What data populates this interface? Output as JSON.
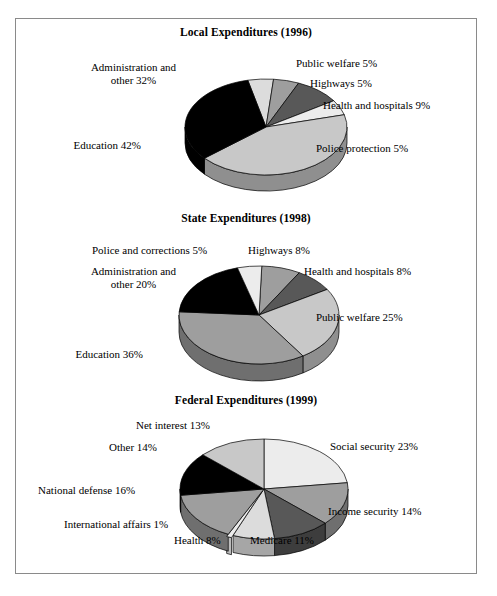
{
  "page": {
    "background": "#ffffff",
    "frame_border_color": "#8a8a8a"
  },
  "palette": {
    "black": "#000000",
    "dark_gray": "#585858",
    "mid_gray": "#9e9e9e",
    "light_gray": "#c8c8c8",
    "pale_gray": "#dcdcdc",
    "very_light": "#ececec",
    "side_black": "#000000",
    "side_dark": "#3d3d3d",
    "side_mid": "#6f6f6f",
    "side_light": "#8f8f8f",
    "side_pale": "#a6a6a6",
    "side_very_light": "#bdbdbd",
    "outline": "#000000"
  },
  "chart_data": [
    {
      "type": "pie",
      "id": "local-expenditures-1996",
      "title": "Local Expenditures (1996)",
      "categories": [
        "Education",
        "Administration and other",
        "Public welfare",
        "Highways",
        "Health and hospitals",
        "Police protection"
      ],
      "values": [
        42,
        32,
        5,
        5,
        9,
        5
      ],
      "labels": [
        "Education 42%",
        "Administration and other 32%",
        "Public welfare 5%",
        "Highways 5%",
        "Health and hospitals 9%",
        "Police protection 5%"
      ],
      "xlabel": "",
      "ylabel": "",
      "legend": "labels-outside",
      "grid": false
    },
    {
      "type": "pie",
      "id": "state-expenditures-1998",
      "title": "State Expenditures (1998)",
      "categories": [
        "Education",
        "Public welfare",
        "Administration and other",
        "Highways",
        "Health and hospitals",
        "Police and corrections"
      ],
      "values": [
        36,
        25,
        20,
        8,
        8,
        5
      ],
      "labels": [
        "Education 36%",
        "Public welfare 25%",
        "Administration and other 20%",
        "Highways 8%",
        "Health and hospitals 8%",
        "Police and corrections 5%"
      ],
      "xlabel": "",
      "ylabel": "",
      "legend": "labels-outside",
      "grid": false
    },
    {
      "type": "pie",
      "id": "federal-expenditures-1999",
      "title": "Federal Expenditures (1999)",
      "categories": [
        "Social security",
        "National defense",
        "Income security",
        "Other",
        "Net interest",
        "Medicare",
        "Health",
        "International affairs"
      ],
      "values": [
        23,
        16,
        14,
        14,
        13,
        11,
        8,
        1
      ],
      "labels": [
        "Social security 23%",
        "National defense 16%",
        "Income security 14%",
        "Other 14%",
        "Net interest 13%",
        "Medicare 11%",
        "Health 8%",
        "International affairs 1%"
      ],
      "xlabel": "",
      "ylabel": "",
      "legend": "labels-outside",
      "grid": false
    }
  ],
  "charts": {
    "local": {
      "title": "Local Expenditures (1996)",
      "label_admin": "Administration and other 32%",
      "label_education": "Education 42%",
      "label_public_welfare": "Public welfare 5%",
      "label_highways": "Highways 5%",
      "label_health": "Health and hospitals 9%",
      "label_police": "Police protection 5%"
    },
    "state": {
      "title": "State Expenditures (1998)",
      "label_police": "Police and corrections 5%",
      "label_highways": "Highways 8%",
      "label_admin": "Administration and other 20%",
      "label_health": "Health and hospitals 8%",
      "label_public_welfare": "Public welfare 25%",
      "label_education": "Education 36%"
    },
    "federal": {
      "title": "Federal Expenditures (1999)",
      "label_net_interest": "Net interest 13%",
      "label_other": "Other 14%",
      "label_social_security": "Social security 23%",
      "label_national_defense": "National defense 16%",
      "label_income_security": "Income security 14%",
      "label_intl": "International affairs 1%",
      "label_health": "Health 8%",
      "label_medicare": "Medicare 11%"
    }
  }
}
